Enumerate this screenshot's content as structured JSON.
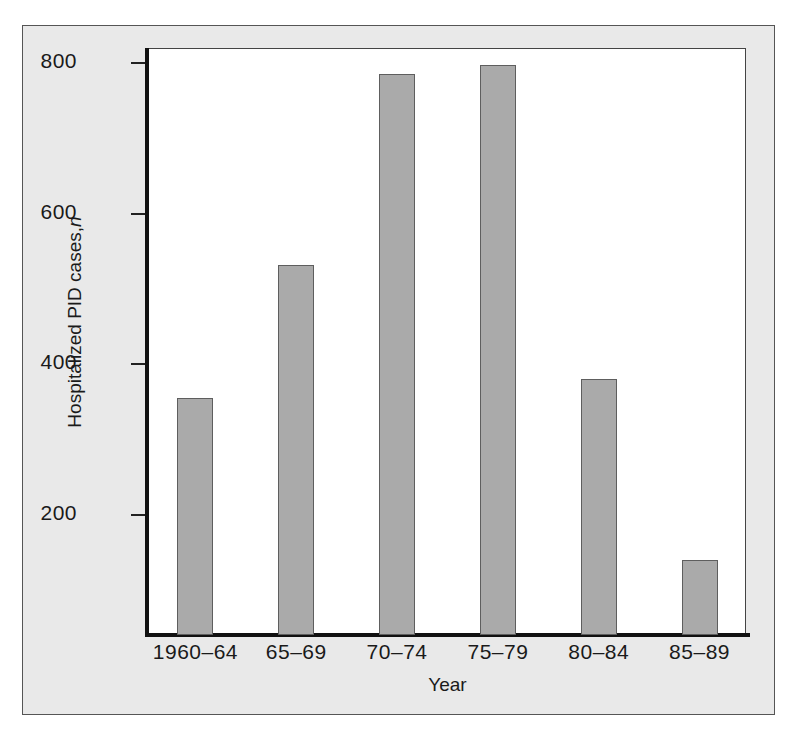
{
  "chart_data": {
    "type": "bar",
    "title": "",
    "subtitle": "",
    "xlabel": "Year",
    "ylabel": "Hospitalized PID cases, n",
    "ylabel_plain": "Hospitalized PID cases,",
    "ylabel_italic": "n",
    "categories": [
      "1960–64",
      "65–69",
      "70–74",
      "75–79",
      "80–84",
      "85–89"
    ],
    "values": [
      355,
      532,
      785,
      797,
      380,
      139
    ],
    "ylim": [
      40,
      820
    ],
    "yticks": [
      200,
      400,
      600,
      800
    ],
    "ytick_labels": [
      "200",
      "400",
      "600",
      "800"
    ],
    "grid": false,
    "legend": null,
    "bar_color": "#aaaaaa",
    "bar_edge_color": "#5e5e5e",
    "plot_background": "#ffffff",
    "figure_background": "#e9e9e9",
    "axis_color": "#111111",
    "text_color": "#1a1a1a"
  }
}
